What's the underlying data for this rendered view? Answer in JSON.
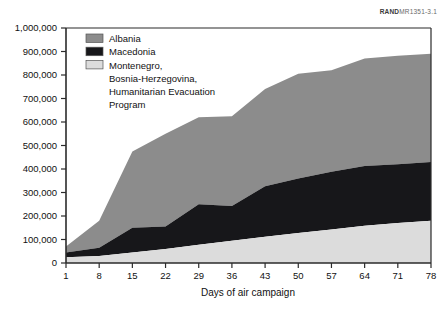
{
  "figure": {
    "source_label_prefix": "RAND",
    "source_label_number": "MR1351-3.1"
  },
  "chart_data": {
    "type": "area",
    "stacked": true,
    "title": "",
    "xlabel": "Days of air campaign",
    "ylabel": "",
    "xlim": [
      1,
      78
    ],
    "ylim": [
      0,
      1000000
    ],
    "grid": false,
    "legend_position": "top-left-inside",
    "x": [
      1,
      8,
      15,
      22,
      29,
      36,
      43,
      50,
      57,
      64,
      71,
      78
    ],
    "xticks": [
      "1",
      "8",
      "15",
      "22",
      "29",
      "36",
      "43",
      "50",
      "57",
      "64",
      "71",
      "78"
    ],
    "yticks": [
      "0",
      "100,000",
      "200,000",
      "300,000",
      "400,000",
      "500,000",
      "600,000",
      "700,000",
      "800,000",
      "900,000",
      "1,000,000"
    ],
    "ytick_values": [
      0,
      100000,
      200000,
      300000,
      400000,
      500000,
      600000,
      700000,
      800000,
      900000,
      1000000
    ],
    "series": [
      {
        "name": "Montenegro, Bosnia-Herzegovina, Humanitarian Evacuation Program",
        "legend_label": "Montenegro,\nBosnia-Herzegovina,\nHumanitarian Evacuation\nProgram",
        "color": "#dcdcdc",
        "stack_order": 1,
        "values": [
          25000,
          30000,
          45000,
          60000,
          78000,
          95000,
          112000,
          128000,
          143000,
          158000,
          170000,
          180000
        ]
      },
      {
        "name": "Macedonia",
        "legend_label": "Macedonia",
        "color": "#17171a",
        "stack_order": 2,
        "values": [
          20000,
          35000,
          105000,
          95000,
          172000,
          148000,
          215000,
          232000,
          245000,
          255000,
          250000,
          250000
        ]
      },
      {
        "name": "Albania",
        "legend_label": "Albania",
        "color": "#8c8c8c",
        "stack_order": 3,
        "values": [
          25000,
          115000,
          325000,
          395000,
          370000,
          382000,
          413000,
          445000,
          432000,
          457000,
          462000,
          460000
        ]
      }
    ],
    "cumulative_top": [
      70000,
      180000,
      475000,
      550000,
      620000,
      625000,
      740000,
      805000,
      820000,
      870000,
      882000,
      890000
    ],
    "boundaries": {
      "light_top": [
        25000,
        30000,
        45000,
        60000,
        78000,
        95000,
        112000,
        128000,
        143000,
        158000,
        170000,
        180000
      ],
      "black_top": [
        45000,
        65000,
        150000,
        155000,
        250000,
        243000,
        327000,
        360000,
        388000,
        413000,
        420000,
        430000
      ]
    }
  },
  "legend": {
    "items": [
      {
        "label": "Albania",
        "swatch": "#8c8c8c"
      },
      {
        "label": "Macedonia",
        "swatch": "#17171a"
      },
      {
        "label": "Montenegro,",
        "swatch": "#dcdcdc"
      }
    ],
    "montenegro_lines": [
      "Montenegro,",
      "Bosnia-Herzegovina,",
      "Humanitarian Evacuation",
      "Program"
    ]
  }
}
